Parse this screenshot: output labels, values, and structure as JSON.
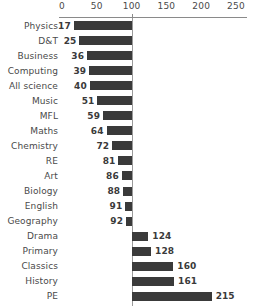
{
  "chart_data": {
    "type": "bar",
    "orientation": "horizontal",
    "title": "",
    "subtitle": "",
    "xlabel": "",
    "ylabel": "",
    "xlim": [
      0,
      250
    ],
    "baseline": 100,
    "grid": false,
    "legend": null,
    "bar_color": "#3a3a3a",
    "axis_color": "#8a8a8a",
    "text_color": "#4a4a4a",
    "note": "Bars span from each category value to the baseline at 100.",
    "xticks": [
      {
        "value": 0,
        "label": "0"
      },
      {
        "value": 50,
        "label": "50"
      },
      {
        "value": 100,
        "label": "100"
      },
      {
        "value": 150,
        "label": "150"
      },
      {
        "value": 200,
        "label": "200"
      },
      {
        "value": 250,
        "label": "250"
      }
    ],
    "categories": [
      "Physics",
      "D&T",
      "Business",
      "Computing",
      "All science",
      "Music",
      "MFL",
      "Maths",
      "Chemistry",
      "RE",
      "Art",
      "Biology",
      "English",
      "Geography",
      "Drama",
      "Primary",
      "Classics",
      "History",
      "PE"
    ],
    "values": [
      17,
      25,
      36,
      39,
      40,
      51,
      59,
      64,
      72,
      81,
      86,
      88,
      91,
      92,
      124,
      128,
      160,
      161,
      215
    ],
    "points": [
      {
        "category": "Physics",
        "value": 17,
        "label": "17"
      },
      {
        "category": "D&T",
        "value": 25,
        "label": "25"
      },
      {
        "category": "Business",
        "value": 36,
        "label": "36"
      },
      {
        "category": "Computing",
        "value": 39,
        "label": "39"
      },
      {
        "category": "All science",
        "value": 40,
        "label": "40"
      },
      {
        "category": "Music",
        "value": 51,
        "label": "51"
      },
      {
        "category": "MFL",
        "value": 59,
        "label": "59"
      },
      {
        "category": "Maths",
        "value": 64,
        "label": "64"
      },
      {
        "category": "Chemistry",
        "value": 72,
        "label": "72"
      },
      {
        "category": "RE",
        "value": 81,
        "label": "81"
      },
      {
        "category": "Art",
        "value": 86,
        "label": "86"
      },
      {
        "category": "Biology",
        "value": 88,
        "label": "88"
      },
      {
        "category": "English",
        "value": 91,
        "label": "91"
      },
      {
        "category": "Geography",
        "value": 92,
        "label": "92"
      },
      {
        "category": "Drama",
        "value": 124,
        "label": "124"
      },
      {
        "category": "Primary",
        "value": 128,
        "label": "128"
      },
      {
        "category": "Classics",
        "value": 160,
        "label": "160"
      },
      {
        "category": "History",
        "value": 161,
        "label": "161"
      },
      {
        "category": "PE",
        "value": 215,
        "label": "215"
      }
    ]
  }
}
